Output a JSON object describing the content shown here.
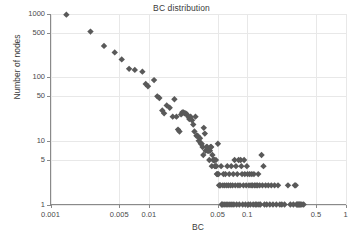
{
  "chart_data": {
    "type": "scatter",
    "title": "BC distribution",
    "xlabel": "BC",
    "ylabel": "Number of nodes",
    "xscale": "log",
    "yscale": "log",
    "xlim": [
      0.001,
      1
    ],
    "ylim": [
      1,
      1000
    ],
    "grid": true,
    "legend": null,
    "marker": "diamond",
    "marker_color": "#595959",
    "marker_size": 3.2,
    "xticks": [
      0.001,
      0.005,
      0.01,
      0.05,
      0.1,
      0.5,
      1
    ],
    "xticklabels": [
      "0.001",
      "0.005",
      "0.01",
      "0.05",
      "0.1",
      "0.5",
      "1"
    ],
    "yticks": [
      1,
      5,
      10,
      50,
      100,
      500,
      1000
    ],
    "yticklabels": [
      "1",
      "5",
      "10",
      "50",
      "100",
      "500",
      "1000"
    ],
    "series": [
      {
        "name": "BC distribution",
        "points": [
          [
            0.00145,
            960
          ],
          [
            0.00255,
            520
          ],
          [
            0.0035,
            310
          ],
          [
            0.0045,
            245
          ],
          [
            0.0053,
            190
          ],
          [
            0.0063,
            135
          ],
          [
            0.0072,
            130
          ],
          [
            0.0086,
            122
          ],
          [
            0.0093,
            78
          ],
          [
            0.0098,
            72
          ],
          [
            0.0113,
            90
          ],
          [
            0.0122,
            50
          ],
          [
            0.0128,
            47
          ],
          [
            0.0137,
            30
          ],
          [
            0.0143,
            27
          ],
          [
            0.0152,
            36
          ],
          [
            0.0163,
            33
          ],
          [
            0.0175,
            24
          ],
          [
            0.0182,
            45
          ],
          [
            0.0191,
            24
          ],
          [
            0.0198,
            15
          ],
          [
            0.0205,
            14
          ],
          [
            0.0213,
            26
          ],
          [
            0.0219,
            28
          ],
          [
            0.0225,
            28
          ],
          [
            0.0231,
            27
          ],
          [
            0.0237,
            27
          ],
          [
            0.0244,
            26
          ],
          [
            0.0252,
            24
          ],
          [
            0.0258,
            22
          ],
          [
            0.0266,
            24
          ],
          [
            0.0275,
            21
          ],
          [
            0.0283,
            18
          ],
          [
            0.0291,
            14
          ],
          [
            0.0298,
            24
          ],
          [
            0.0305,
            12
          ],
          [
            0.0313,
            12
          ],
          [
            0.0322,
            10
          ],
          [
            0.0331,
            11
          ],
          [
            0.0338,
            9
          ],
          [
            0.0345,
            9
          ],
          [
            0.0352,
            8
          ],
          [
            0.0358,
            6
          ],
          [
            0.0362,
            16
          ],
          [
            0.0371,
            13
          ],
          [
            0.0378,
            7
          ],
          [
            0.0385,
            8
          ],
          [
            0.0392,
            8
          ],
          [
            0.0398,
            7
          ],
          [
            0.0404,
            7
          ],
          [
            0.0412,
            5
          ],
          [
            0.0418,
            7
          ],
          [
            0.0424,
            8
          ],
          [
            0.0431,
            8
          ],
          [
            0.0437,
            4
          ],
          [
            0.0443,
            6
          ],
          [
            0.0451,
            5
          ],
          [
            0.0458,
            5
          ],
          [
            0.0463,
            5
          ],
          [
            0.0469,
            4
          ],
          [
            0.0474,
            4
          ],
          [
            0.0481,
            5
          ],
          [
            0.0487,
            4
          ],
          [
            0.0492,
            3
          ],
          [
            0.0498,
            3
          ],
          [
            0.0504,
            9
          ],
          [
            0.0511,
            3
          ],
          [
            0.0518,
            2
          ],
          [
            0.0526,
            2
          ],
          [
            0.0534,
            2
          ],
          [
            0.0543,
            4
          ],
          [
            0.0551,
            1
          ],
          [
            0.0558,
            1
          ],
          [
            0.0566,
            2
          ],
          [
            0.0574,
            3
          ],
          [
            0.0582,
            1
          ],
          [
            0.0591,
            2
          ],
          [
            0.06,
            3
          ],
          [
            0.061,
            1
          ],
          [
            0.062,
            2
          ],
          [
            0.0628,
            4
          ],
          [
            0.0637,
            1
          ],
          [
            0.0646,
            2
          ],
          [
            0.0657,
            3
          ],
          [
            0.0668,
            1
          ],
          [
            0.0678,
            2
          ],
          [
            0.0689,
            4
          ],
          [
            0.07,
            1
          ],
          [
            0.0711,
            2
          ],
          [
            0.0722,
            3
          ],
          [
            0.0733,
            1
          ],
          [
            0.0745,
            5
          ],
          [
            0.0757,
            2
          ],
          [
            0.0769,
            4
          ],
          [
            0.0781,
            1
          ],
          [
            0.0793,
            3
          ],
          [
            0.0806,
            2
          ],
          [
            0.0819,
            5
          ],
          [
            0.0832,
            1
          ],
          [
            0.0845,
            2
          ],
          [
            0.0859,
            5
          ],
          [
            0.0873,
            4
          ],
          [
            0.0887,
            3
          ],
          [
            0.0901,
            1
          ],
          [
            0.0916,
            2
          ],
          [
            0.0931,
            5
          ],
          [
            0.0946,
            3
          ],
          [
            0.0961,
            1
          ],
          [
            0.0977,
            2
          ],
          [
            0.0993,
            4
          ],
          [
            0.101,
            3
          ],
          [
            0.1026,
            1
          ],
          [
            0.1043,
            2
          ],
          [
            0.1061,
            3
          ],
          [
            0.1078,
            1
          ],
          [
            0.1096,
            2
          ],
          [
            0.1115,
            3
          ],
          [
            0.1133,
            2
          ],
          [
            0.1152,
            1
          ],
          [
            0.1172,
            3
          ],
          [
            0.1191,
            2
          ],
          [
            0.1211,
            1
          ],
          [
            0.1232,
            2
          ],
          [
            0.1253,
            1
          ],
          [
            0.1274,
            2
          ],
          [
            0.1296,
            3
          ],
          [
            0.1318,
            1
          ],
          [
            0.134,
            2
          ],
          [
            0.1363,
            1
          ],
          [
            0.14,
            6
          ],
          [
            0.143,
            2
          ],
          [
            0.1465,
            4
          ],
          [
            0.15,
            1
          ],
          [
            0.154,
            2
          ],
          [
            0.158,
            1
          ],
          [
            0.164,
            2
          ],
          [
            0.17,
            1
          ],
          [
            0.176,
            2
          ],
          [
            0.183,
            1
          ],
          [
            0.19,
            2
          ],
          [
            0.198,
            1
          ],
          [
            0.206,
            2
          ],
          [
            0.215,
            1
          ],
          [
            0.225,
            1
          ],
          [
            0.24,
            1
          ],
          [
            0.26,
            2
          ],
          [
            0.275,
            1
          ],
          [
            0.295,
            1
          ],
          [
            0.305,
            2
          ],
          [
            0.312,
            2
          ],
          [
            0.318,
            1
          ],
          [
            0.324,
            1
          ],
          [
            0.33,
            1
          ],
          [
            0.336,
            1
          ],
          [
            0.342,
            1
          ],
          [
            0.35,
            1
          ],
          [
            0.36,
            1
          ],
          [
            0.375,
            1
          ]
        ]
      }
    ]
  },
  "axes": {
    "x_title": "BC",
    "y_title": "Number of nodes"
  }
}
